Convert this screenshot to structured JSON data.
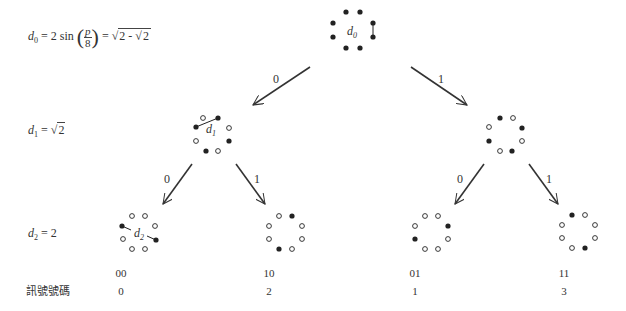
{
  "equations": {
    "d0": {
      "var": "d",
      "sub": "0",
      "expr_prefix": "= 2 sin",
      "frac_num": "p",
      "frac_den": "8",
      "expr_suffix": "=",
      "sqrt_outer_a": "2 -",
      "sqrt_inner": "2"
    },
    "d1": {
      "var": "d",
      "sub": "1",
      "eq": "=",
      "sqrt": "2"
    },
    "d2": {
      "var": "d",
      "sub": "2",
      "eq": "= 2"
    }
  },
  "tree": {
    "root": {
      "label_var": "d",
      "label_sub": "0",
      "points": [
        "filled",
        "filled",
        "filled",
        "filled",
        "filled",
        "filled",
        "filled",
        "filled"
      ]
    },
    "edges": [
      {
        "label": "0"
      },
      {
        "label": "1"
      },
      {
        "label": "0"
      },
      {
        "label": "1"
      },
      {
        "label": "0"
      },
      {
        "label": "1"
      }
    ],
    "level1": [
      {
        "label_var": "d",
        "label_sub": "1"
      },
      {
        "label_var": "",
        "label_sub": ""
      }
    ],
    "level2": [
      {
        "label_var": "d",
        "label_sub": "2",
        "bits": "00",
        "signal": "0"
      },
      {
        "label_var": "",
        "label_sub": "",
        "bits": "10",
        "signal": "2"
      },
      {
        "label_var": "",
        "label_sub": "",
        "bits": "01",
        "signal": "1"
      },
      {
        "label_var": "",
        "label_sub": "",
        "bits": "11",
        "signal": "3"
      }
    ]
  },
  "footer": {
    "signal_number_label": "訊號號碼"
  },
  "colors": {
    "ink": "#222222",
    "arrow": "#333333",
    "background": "#ffffff"
  }
}
